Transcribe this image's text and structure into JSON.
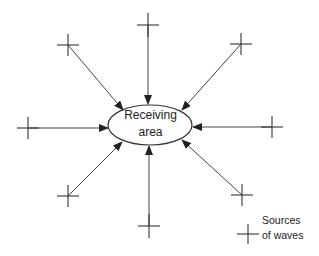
{
  "diagram": {
    "center": {
      "line1": "Receiving",
      "line2": "area"
    },
    "legend": {
      "line1": "Sources",
      "line2": "of waves"
    },
    "sources": [
      {
        "name": "top",
        "x": 148,
        "y": 25
      },
      {
        "name": "top-right",
        "x": 241,
        "y": 44
      },
      {
        "name": "right",
        "x": 272,
        "y": 127
      },
      {
        "name": "bottom-right",
        "x": 242,
        "y": 195
      },
      {
        "name": "bottom",
        "x": 149,
        "y": 226
      },
      {
        "name": "bottom-left",
        "x": 68,
        "y": 196
      },
      {
        "name": "left",
        "x": 28,
        "y": 128
      },
      {
        "name": "top-left",
        "x": 68,
        "y": 45
      }
    ],
    "colors": {
      "line": "#333333",
      "background": "#ffffff"
    }
  }
}
